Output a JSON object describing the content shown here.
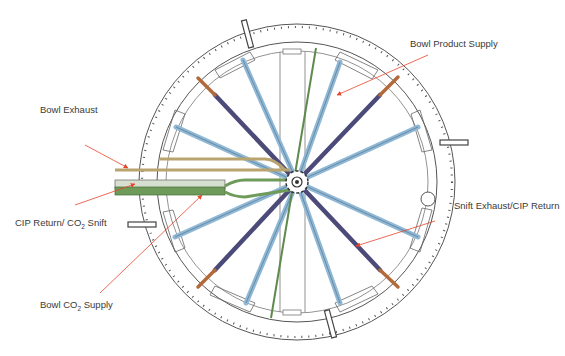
{
  "diagram": {
    "type": "radial bowl piping layout (top view)",
    "colors": {
      "spoke_blue": "#8fb8d6",
      "spoke_purple": "#4b4a78",
      "exhaust_tan": "#b9a36e",
      "co2_green": "#6e9a5a",
      "heater_copper": "#b36a3a",
      "annotation_arrow": "#e8452b",
      "outline": "#555555"
    }
  },
  "labels": {
    "bowl_product_supply": "Bowl Product Supply",
    "bowl_exhaust": "Bowl Exhaust",
    "cip_return_prefix": "CIP Return/ CO",
    "cip_return_sub": "2",
    "cip_return_suffix": " Snift",
    "snift_exhaust": "Snift Exhaust/CIP Return",
    "bowl_co2_prefix": "Bowl CO",
    "bowl_co2_sub": "2",
    "bowl_co2_suffix": " Supply"
  }
}
